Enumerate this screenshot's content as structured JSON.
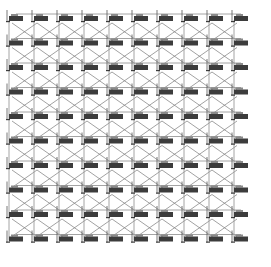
{
  "diagram": {
    "type": "mesh-network-grid",
    "rows": 10,
    "cols": 10,
    "origin_x": 15,
    "origin_y": 18,
    "pitch_x": 25,
    "pitch_y": 24.5,
    "node_icon": "network-device-icon",
    "links": {
      "horizontal": true,
      "vertical": true,
      "diagonal_cross": true
    },
    "colors": {
      "background": "#ffffff",
      "grid_line": "#9a9a9a",
      "diagonal_line": "#7a7a7a",
      "node_body": "#3c3c3c",
      "node_top": "#8a8a8a"
    }
  }
}
